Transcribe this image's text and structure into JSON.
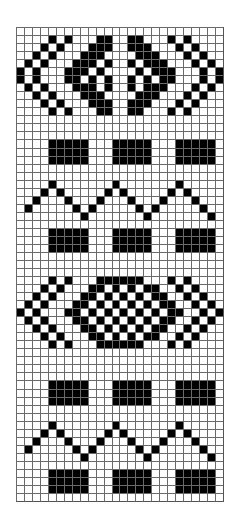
{
  "pattern": {
    "columns": 26,
    "rows": 59,
    "colors": {
      "filled": "#000000",
      "empty": "#ffffff",
      "gridline": "#6a6a6a"
    },
    "grid": [
      "..........................",
      "....#.#...##..##...#.#....",
      "...#.#...###..###...#.#...",
      "..#.#...###....###...#.#..",
      ".#.#...###.#..#.###...#.#.",
      "#.#...###.#....#.###...#.#",
      "#.#...##.#.#..#.#.##...#.#",
      ".#.#...###.#..#.###...#.#.",
      "..#.#...###....###...#.#..",
      "...#.#...###..###...#.#...",
      "....#.#...##..##...#.#....",
      "..........................",
      "..........................",
      "..........................",
      "....#####...#####...#####.",
      "....#####...#####...#####.",
      "....#####...#####...#####.",
      "..........................",
      "..........................",
      "....#.......#.......#.....",
      "...#.#.....#.#.....#.#....",
      "..#...#...#...#...#...#...",
      ".#.....#.#.....#.#.....#..",
      "........#.......#.......#.",
      "..........................",
      "....#####...#####...#####.",
      "....#####...#####...#####.",
      "....#####...#####...#####.",
      "..........................",
      "..........................",
      "..........................",
      "....#.#...######...#.#....",
      "...#.#...##.#.#.##..#.#...",
      "..#.#...##.#.#.#.##..#.#..",
      ".#.#...##.#.#.#.#.##..#.#.",
      "#.#...##.#.#.#.#.#.##..#.#",
      ".#.#...##.#.#.#.#.##..#.#.",
      "..#.#...##.#.#.#.##..#.#..",
      "...#.#...##.#.#.##..#.#...",
      "....#.#...######...#.#....",
      "..........................",
      "..........................",
      "..........................",
      "..........................",
      "....#####...#####...#####.",
      "....#####...#####...#####.",
      "....#####...#####...#####.",
      "..........................",
      "..........................",
      "....#.......#.......#.....",
      "...#.#.....#.#.....#.#....",
      "..#...#...#...#...#...#...",
      ".#.....#.#.....#.#.....#..",
      "........#.......#.......#.",
      "..........................",
      "....#####...#####...#####.",
      "....#####...#####...#####.",
      "....#####...#####...#####.",
      ".........................."
    ]
  }
}
